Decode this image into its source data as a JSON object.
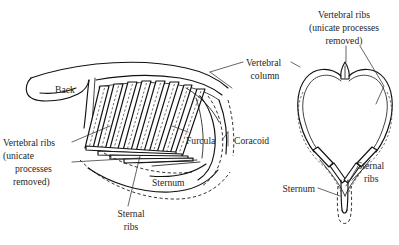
{
  "figure": {
    "background_color": "#ffffff",
    "ink_color": "#111111",
    "text_color": "#262626",
    "views": [
      {
        "name": "lateral-view",
        "position": "left"
      },
      {
        "name": "cross-section-view",
        "position": "right"
      }
    ]
  },
  "labels": {
    "back": "Back",
    "vertebral_column": {
      "line1": "Vertebral",
      "line2": "column"
    },
    "vertebral_ribs_left": {
      "line1": "Vertebral ribs",
      "line2": "(unicate",
      "line3": "processes",
      "line4": "removed)"
    },
    "vertebral_ribs_right": {
      "line1": "Vertebral ribs",
      "line2": "(unicate processes",
      "line3": "removed)"
    },
    "furcula": "Furcula",
    "coracoid": "Coracoid",
    "sternum_left": "Sternum",
    "sternum_right": "Sternum",
    "sternal_ribs_left": {
      "line1": "Sternal",
      "line2": "ribs"
    },
    "sternal_ribs_right": {
      "line1": "Sternal",
      "line2": "ribs"
    }
  }
}
